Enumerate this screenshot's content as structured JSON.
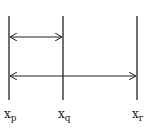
{
  "diagram": {
    "lines": [
      {
        "id": "p",
        "x": 9,
        "label": "x",
        "subscript": "p"
      },
      {
        "id": "q",
        "x": 63,
        "label": "x",
        "subscript": "q"
      },
      {
        "id": "r",
        "x": 137,
        "label": "x",
        "subscript": "r"
      }
    ],
    "arrows": [
      {
        "from": "p",
        "to": "q",
        "y": 37,
        "type": "double-headed"
      },
      {
        "from": "p",
        "to": "r",
        "y": 76,
        "type": "double-headed"
      }
    ],
    "colors": {
      "stroke": "#222222",
      "background": "#ffffff"
    }
  }
}
